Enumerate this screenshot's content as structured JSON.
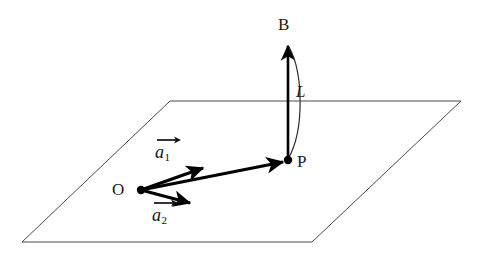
{
  "figure": {
    "background_color": "#ffffff",
    "plane": {
      "name": "reference-plane",
      "stroke_color": "#4a4a4a",
      "stroke_width": 1,
      "fill": "none",
      "corners": [
        {
          "label": "top-left",
          "x": 170,
          "y": 101
        },
        {
          "label": "top-right",
          "x": 461,
          "y": 101
        },
        {
          "label": "bottom-right",
          "x": 312,
          "y": 242
        },
        {
          "label": "bottom-left",
          "x": 22,
          "y": 242
        }
      ]
    },
    "points": [
      {
        "id": "O",
        "label": "O",
        "x": 141,
        "y": 190,
        "label_x": 112,
        "label_y": 181,
        "dot": true,
        "dot_radius": 4
      },
      {
        "id": "P",
        "label": "P",
        "x": 288,
        "y": 161,
        "label_x": 297,
        "label_y": 153,
        "dot": true,
        "dot_radius": 4
      },
      {
        "id": "B",
        "label": "B",
        "x": 288,
        "y": 43,
        "label_x": 278,
        "label_y": 17,
        "dot": false,
        "dot_radius": 0
      }
    ],
    "vectors": [
      {
        "id": "OP",
        "name": "vector-op",
        "label": "",
        "from": {
          "x": 141,
          "y": 190
        },
        "to": {
          "x": 288,
          "y": 161
        },
        "stroke_color": "#000000",
        "stroke_width": 3.2
      },
      {
        "id": "a1",
        "name": "vector-a1",
        "label": "a",
        "subscript": "1",
        "from": {
          "x": 141,
          "y": 190
        },
        "to": {
          "x": 206,
          "y": 167
        },
        "stroke_color": "#000000",
        "stroke_width": 3.2,
        "label_x": 155,
        "label_y": 137
      },
      {
        "id": "a2",
        "name": "vector-a2",
        "label": "a",
        "subscript": "2",
        "from": {
          "x": 141,
          "y": 190
        },
        "to": {
          "x": 194,
          "y": 204
        },
        "stroke_color": "#000000",
        "stroke_width": 3.2,
        "label_x": 152,
        "label_y": 199
      },
      {
        "id": "PB",
        "name": "vector-pb",
        "label": "",
        "from": {
          "x": 288,
          "y": 160
        },
        "to": {
          "x": 288,
          "y": 43
        },
        "stroke_color": "#000000",
        "stroke_width": 2.6
      }
    ],
    "arc": {
      "id": "L",
      "name": "arc-length-l",
      "label": "L",
      "label_x": 297,
      "label_y": 82,
      "stroke_color": "#2b2b2b",
      "stroke_width": 1.2,
      "start": {
        "x": 289,
        "y": 47
      },
      "end": {
        "x": 288,
        "y": 159
      },
      "bulge_x": 305,
      "bulge_y": 103
    },
    "labels": {
      "origin": "O",
      "point_p": "P",
      "point_b": "B",
      "arc_length": "L",
      "vector_a1_base": "a",
      "vector_a1_sub": "1",
      "vector_a2_base": "a",
      "vector_a2_sub": "2"
    }
  }
}
